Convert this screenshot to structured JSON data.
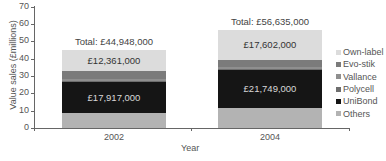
{
  "chart_data": {
    "type": "bar",
    "stacked": true,
    "title": "",
    "xlabel": "Year",
    "ylabel": "Value sales (£millions)",
    "ylim": [
      0,
      70
    ],
    "yticks": [
      0,
      10,
      20,
      30,
      40,
      50,
      60,
      70
    ],
    "categories": [
      "2002",
      "2004"
    ],
    "series": [
      {
        "name": "Others",
        "color": "#b3b3b3",
        "values": [
          8.6,
          11.5
        ]
      },
      {
        "name": "UniBond",
        "color": "#151515",
        "values": [
          17.917,
          21.749
        ]
      },
      {
        "name": "Polycell",
        "color": "#6e6e6e",
        "values": [
          0.6,
          0.7
        ]
      },
      {
        "name": "Vallance",
        "color": "#8f8f8f",
        "values": [
          1.0,
          1.2
        ]
      },
      {
        "name": "Evo-stik",
        "color": "#7b7b7b",
        "values": [
          4.47,
          3.88
        ]
      },
      {
        "name": "Own-label",
        "color": "#dcdcdc",
        "values": [
          12.361,
          17.602
        ]
      }
    ],
    "segment_labels": [
      {
        "category": "2002",
        "series": "UniBond",
        "text": "£17,917,000"
      },
      {
        "category": "2002",
        "series": "Own-label",
        "text": "£12,361,000"
      },
      {
        "category": "2004",
        "series": "UniBond",
        "text": "£21,749,000"
      },
      {
        "category": "2004",
        "series": "Own-label",
        "text": "£17,602,000"
      }
    ],
    "totals": [
      {
        "category": "2002",
        "value": 44.948,
        "text": "Total: £44,948,000"
      },
      {
        "category": "2004",
        "value": 56.635,
        "text": "Total: £56,635,000"
      }
    ],
    "legend": {
      "position": "right",
      "entries": [
        "Own-label",
        "Evo-stik",
        "Vallance",
        "Polycell",
        "UniBond",
        "Others"
      ]
    },
    "grid": false
  }
}
